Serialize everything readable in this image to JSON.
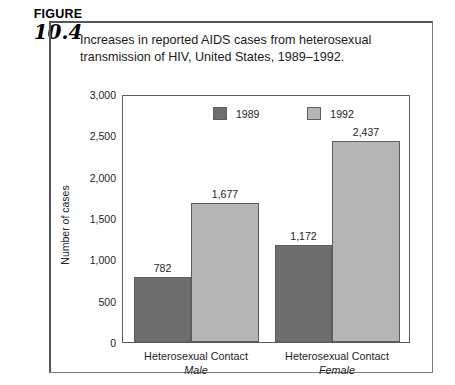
{
  "figure": {
    "label_word": "FIGURE",
    "number": "10.4",
    "caption_line1": "Increases in reported AIDS cases from heterosexual",
    "caption_line2": "transmission of HIV, United States, 1989–1992."
  },
  "colors": {
    "series_1989": "#6e6e6e",
    "series_1992": "#b5b5b5",
    "axis": "#5a5b5f",
    "text": "#1b1b1b"
  },
  "chart_data": {
    "type": "bar",
    "title": "Increases in reported AIDS cases from heterosexual transmission of HIV, United States, 1989–1992.",
    "xlabel": "",
    "ylabel": "Number of cases",
    "ylim": [
      0,
      3000
    ],
    "yticks": [
      0,
      500,
      1000,
      1500,
      2000,
      2500,
      3000
    ],
    "ytick_labels": [
      "0",
      "500",
      "1,000",
      "1,500",
      "2,000",
      "2,500",
      "3,000"
    ],
    "grid": false,
    "legend_position": "top-center-inside",
    "categories": [
      "Heterosexual Contact",
      "Heterosexual Contact"
    ],
    "category_sublabels": [
      "Male",
      "Female"
    ],
    "series": [
      {
        "name": "1989",
        "color": "#6e6e6e",
        "values": [
          782,
          1172
        ],
        "value_labels": [
          "782",
          "1,172"
        ]
      },
      {
        "name": "1992",
        "color": "#b5b5b5",
        "values": [
          1677,
          2437
        ],
        "value_labels": [
          "1,677",
          "2,437"
        ]
      }
    ]
  }
}
